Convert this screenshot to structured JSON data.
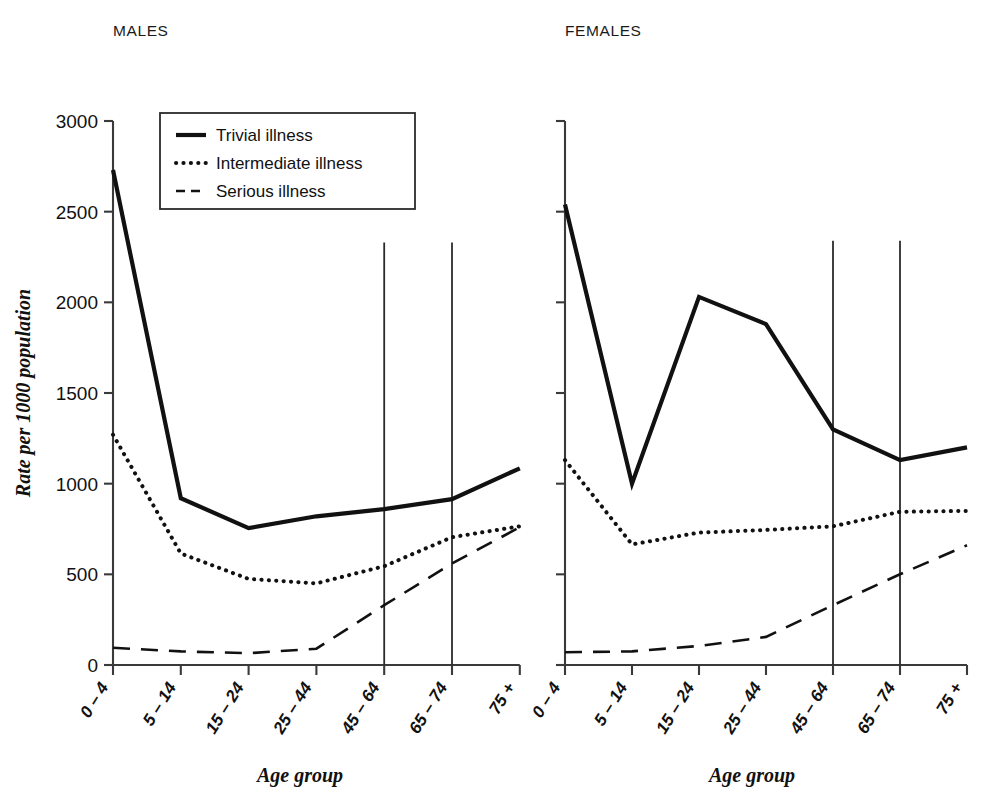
{
  "figure": {
    "panels": [
      {
        "key": "males",
        "title": "MALES",
        "xlabel": "Age group"
      },
      {
        "key": "females",
        "title": "FEMALES",
        "xlabel": "Age group"
      }
    ],
    "ylabel": "Rate per 1000 population",
    "legend": {
      "items": [
        {
          "label": "Trivial illness",
          "style": "solid",
          "icon": "solid-line-swatch"
        },
        {
          "label": "Intermediate illness",
          "style": "dotted",
          "icon": "dotted-line-swatch"
        },
        {
          "label": "Serious illness",
          "style": "dashed",
          "icon": "dashed-line-swatch"
        }
      ]
    }
  },
  "chart_data": {
    "type": "line",
    "title": "",
    "xlabel": "Age group",
    "ylabel": "Rate per 1000 population",
    "categories": [
      "0 – 4",
      "5 – 14",
      "15 – 24",
      "25 – 44",
      "45 – 64",
      "65 – 74",
      "75 +"
    ],
    "ylim": [
      0,
      3000
    ],
    "yticks": [
      0,
      500,
      1000,
      1500,
      2000,
      2500,
      3000
    ],
    "ytick_labels": [
      "0",
      "500",
      "1000",
      "1500",
      "2000",
      "2500",
      "3000"
    ],
    "grid": false,
    "legend_position": "upper-left-inside-male-panel",
    "annotations": [
      {
        "type": "vertical-reference-line",
        "panel": "MALES",
        "category": "45 – 64",
        "from": 0,
        "to": 2330
      },
      {
        "type": "vertical-reference-line",
        "panel": "MALES",
        "category": "65 – 74",
        "from": 0,
        "to": 2330
      },
      {
        "type": "vertical-reference-line",
        "panel": "FEMALES",
        "category": "45 – 64",
        "from": 0,
        "to": 2340
      },
      {
        "type": "vertical-reference-line",
        "panel": "FEMALES",
        "category": "65 – 74",
        "from": 0,
        "to": 2340
      }
    ],
    "panels": [
      {
        "name": "MALES",
        "series": [
          {
            "name": "Trivial illness",
            "style": "solid",
            "values": [
              2730,
              920,
              755,
              820,
              860,
              915,
              1085
            ]
          },
          {
            "name": "Intermediate illness",
            "style": "dotted",
            "values": [
              1270,
              615,
              475,
              450,
              545,
              705,
              765
            ]
          },
          {
            "name": "Serious illness",
            "style": "dashed",
            "values": [
              95,
              75,
              65,
              90,
              330,
              560,
              760
            ]
          }
        ]
      },
      {
        "name": "FEMALES",
        "series": [
          {
            "name": "Trivial illness",
            "style": "solid",
            "values": [
              2540,
              1000,
              2030,
              1880,
              1300,
              1130,
              1200
            ]
          },
          {
            "name": "Intermediate illness",
            "style": "dotted",
            "values": [
              1130,
              665,
              730,
              745,
              765,
              845,
              850
            ]
          },
          {
            "name": "Serious illness",
            "style": "dashed",
            "values": [
              70,
              75,
              105,
              155,
              330,
              500,
              660
            ]
          }
        ]
      }
    ]
  }
}
